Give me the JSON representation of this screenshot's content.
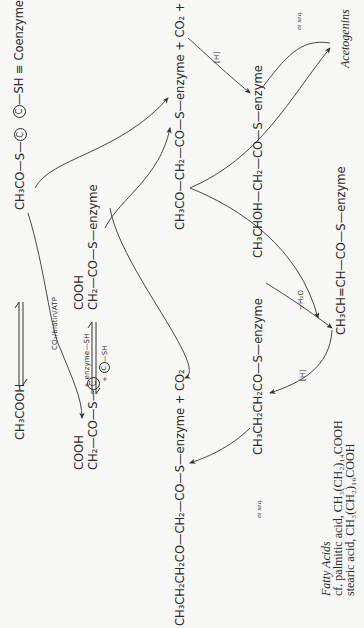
{
  "diagram": {
    "orientation": "rotated 90 degrees counter-clockwise",
    "legend": {
      "symbol": "C",
      "text": "—SH ≡ Coenzyme A)"
    },
    "nodes": {
      "acetic_acid": "CH₃COOH",
      "acetyl_coa": {
        "prefix": "CH₃CO—S—",
        "symbol": "C"
      },
      "malonyl_coa": {
        "top": "COOH",
        "bottom": "CH₂—CO—S—",
        "symbol": "C"
      },
      "malonyl_enzyme": {
        "top": "COOH",
        "bottom": "CH₂—CO—S—enzyme"
      },
      "acetoacetyl_enzyme": {
        "text": "CH₃CO—CH₂—CO—S—enzyme + CO₂ + ",
        "symbol": "C",
        "suffix": "—SH"
      },
      "hydroxybutyryl_enzyme": "CH₃CHOH—CH₂—CO—S—enzyme",
      "crotonyl_enzyme": "CH₃CH=CH—CO—S—enzyme",
      "butyryl_enzyme": "CH₃CH₂CH₂CO—S—enzyme",
      "ketohexanoyl_enzyme": "CH₃CH₂CH₂CO—CH₂—CO—S—enzyme + CO₂",
      "acetogenins": "Acetogenins",
      "fatty_acids": {
        "title": "Fatty Acids",
        "line1": "cf. palmitic acid, CH₃(CH₂)₁₄COOH",
        "line2": "stearic acid, CH₃(CH₂)₁₆COOH"
      }
    },
    "labels": {
      "carboxylation": "CO₂/biotin/ATP",
      "transfer_top": "+ enzyme—SH",
      "transfer_bottom_prefix": "+ ",
      "transfer_bottom_symbol": "C",
      "transfer_bottom_suffix": "—SH",
      "reduction_1": "[H]",
      "dehydration": "−H₂O",
      "reduction_2": "[H]",
      "et_seq_1": "et seq.",
      "et_seq_2": "et seq."
    }
  }
}
